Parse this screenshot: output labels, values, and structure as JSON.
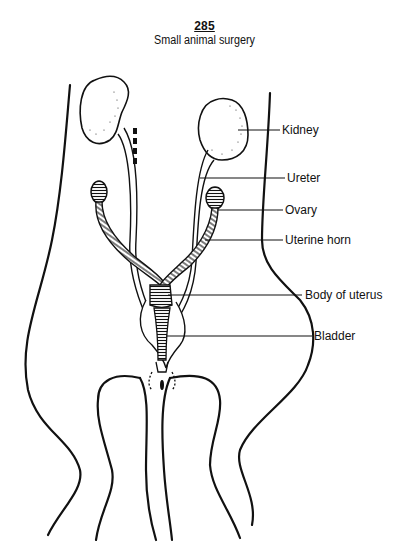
{
  "header": {
    "page_number": "285",
    "running_title": "Small animal surgery"
  },
  "figure": {
    "type": "anatomical line drawing",
    "labels": [
      {
        "id": "kidney",
        "text": "Kidney"
      },
      {
        "id": "ureter",
        "text": "Ureter"
      },
      {
        "id": "ovary",
        "text": "Ovary"
      },
      {
        "id": "uterine-horn",
        "text": "Uterine horn"
      },
      {
        "id": "body-of-uterus",
        "text": "Body of uterus"
      },
      {
        "id": "bladder",
        "text": "Bladder"
      }
    ]
  }
}
